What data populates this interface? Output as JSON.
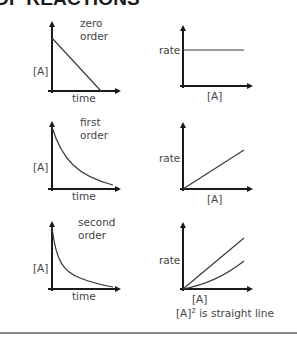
{
  "header": {
    "title": "OF REACTIONS"
  },
  "rows": [
    {
      "order_label_line1": "zero",
      "order_label_line2": "order",
      "conc_plot": {
        "y_label": "[A]",
        "x_label": "time",
        "shape": "linear-decrease"
      },
      "rate_plot": {
        "y_label": "rate",
        "x_label": "[A]",
        "shape": "horizontal-line"
      }
    },
    {
      "order_label_line1": "first",
      "order_label_line2": "order",
      "conc_plot": {
        "y_label": "[A]",
        "x_label": "time",
        "shape": "exponential-decay"
      },
      "rate_plot": {
        "y_label": "rate",
        "x_label": "[A]",
        "shape": "straight-line-through-origin"
      }
    },
    {
      "order_label_line1": "second",
      "order_label_line2": "order",
      "conc_plot": {
        "y_label": "[A]",
        "x_label": "time",
        "shape": "steep-decay"
      },
      "rate_plot": {
        "y_label": "rate",
        "x_label": "[A]",
        "shape": "curve-and-straight-line",
        "note_prefix": "[A]",
        "note_sup": "2",
        "note_suffix": " is straight line"
      }
    }
  ],
  "colors": {
    "axis": "#1a1a1a",
    "curve": "#3a3a3a",
    "text": "#444444",
    "divider": "#8a8a8a"
  }
}
